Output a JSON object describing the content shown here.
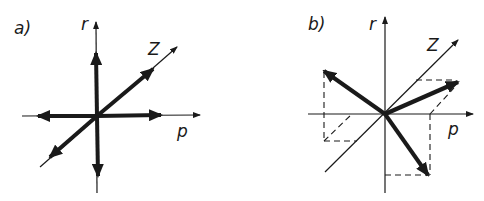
{
  "panels": [
    {
      "id": "a",
      "label": "a)",
      "axes": {
        "r": "r",
        "z": "Z",
        "p": "p"
      },
      "arrows": [
        "+r",
        "-r",
        "+p",
        "-p",
        "+Z",
        "-Z"
      ]
    },
    {
      "id": "b",
      "label": "b)",
      "axes": {
        "r": "r",
        "z": "Z",
        "p": "p"
      },
      "arrows": [
        "upper-left (-p,+r)",
        "right along +Z/+p, raised",
        "lower-right (+p,-r)"
      ],
      "projection_lines": "dashed"
    }
  ],
  "colors": {
    "ink": "#1a1a1a",
    "background": "#ffffff"
  }
}
